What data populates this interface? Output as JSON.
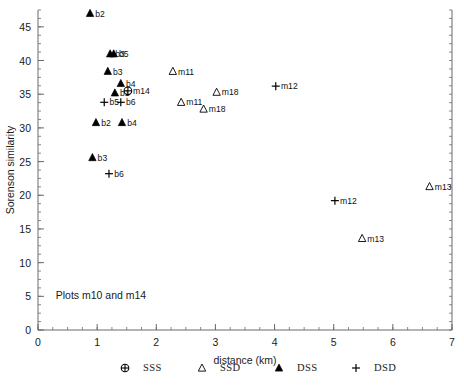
{
  "chart_data": {
    "type": "scatter",
    "title": "",
    "annotation": "Plots m10 and m14",
    "xlabel": "distance (km)",
    "ylabel": "Sorenson similarity",
    "xlim": [
      0,
      7
    ],
    "ylim": [
      0,
      47.5
    ],
    "xticks": [
      0,
      1,
      2,
      3,
      4,
      5,
      6,
      7
    ],
    "xticklabels": [
      "0",
      "1",
      "2",
      "3",
      "4",
      "5",
      "6",
      "7"
    ],
    "yticks": [
      0,
      5,
      10,
      15,
      20,
      25,
      30,
      35,
      40,
      45
    ],
    "yticklabels": [
      "0",
      "5",
      "10",
      "15",
      "20",
      "25",
      "30",
      "35",
      "40",
      "45"
    ],
    "x_minor_interval": 0.25,
    "y_minor_interval": 1.25,
    "grid": false,
    "legend_position": "below-axis",
    "right_spine": true,
    "legend": [
      {
        "key": "SSS",
        "marker": "circle-plus",
        "label": "SSS"
      },
      {
        "key": "SSD",
        "marker": "open-triangle",
        "label": "SSD"
      },
      {
        "key": "DSS",
        "marker": "filled-triangle",
        "label": "DSS"
      },
      {
        "key": "DSD",
        "marker": "plus",
        "label": "DSD"
      }
    ],
    "series": [
      {
        "name": "SSS",
        "marker": "circle-plus",
        "points": [
          {
            "x": 1.52,
            "y": 35.5,
            "label": "m14"
          }
        ]
      },
      {
        "name": "SSD",
        "marker": "open-triangle",
        "points": [
          {
            "x": 2.28,
            "y": 38.4,
            "label": "m11"
          },
          {
            "x": 2.42,
            "y": 33.8,
            "label": "m11"
          },
          {
            "x": 3.02,
            "y": 35.3,
            "label": "m18"
          },
          {
            "x": 2.8,
            "y": 32.8,
            "label": "m18"
          },
          {
            "x": 6.62,
            "y": 21.3,
            "label": "m13"
          },
          {
            "x": 5.48,
            "y": 13.6,
            "label": "m13"
          }
        ]
      },
      {
        "name": "DSS",
        "marker": "filled-triangle",
        "points": [
          {
            "x": 0.88,
            "y": 47.0,
            "label": "b2"
          },
          {
            "x": 1.28,
            "y": 41.0,
            "label": "b5"
          },
          {
            "x": 1.22,
            "y": 41.0,
            "label": "b3"
          },
          {
            "x": 1.18,
            "y": 38.4,
            "label": "b3"
          },
          {
            "x": 1.4,
            "y": 36.6,
            "label": "b4"
          },
          {
            "x": 1.3,
            "y": 35.2,
            "label": "b1"
          },
          {
            "x": 0.98,
            "y": 30.8,
            "label": "b2"
          },
          {
            "x": 1.42,
            "y": 30.8,
            "label": "b4"
          },
          {
            "x": 0.92,
            "y": 25.6,
            "label": "b3"
          }
        ]
      },
      {
        "name": "DSD",
        "marker": "plus",
        "points": [
          {
            "x": 1.12,
            "y": 33.8,
            "label": "b5"
          },
          {
            "x": 1.4,
            "y": 33.8,
            "label": "b6"
          },
          {
            "x": 1.2,
            "y": 23.2,
            "label": "b6"
          },
          {
            "x": 4.02,
            "y": 36.2,
            "label": "m12"
          },
          {
            "x": 5.02,
            "y": 19.2,
            "label": "m12"
          }
        ]
      }
    ]
  }
}
